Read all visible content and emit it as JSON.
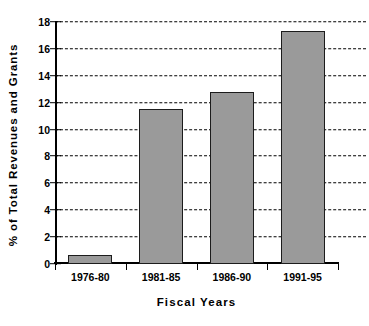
{
  "chart_data": {
    "type": "bar",
    "title": "",
    "categories": [
      "1976-80",
      "1981-85",
      "1986-90",
      "1991-95"
    ],
    "values": [
      0.7,
      11.5,
      12.8,
      17.3
    ],
    "xlabel": "Fiscal  Years",
    "ylabel": "% of Total Revenues and Grants",
    "ylim": [
      0,
      18
    ],
    "yticks": [
      0,
      2,
      4,
      6,
      8,
      10,
      12,
      14,
      16,
      18
    ],
    "ytick_labels": [
      "0",
      "2",
      "4",
      "6",
      "8",
      "10",
      "12",
      "14",
      "16",
      "18"
    ],
    "grid": true,
    "grid_style": "dashed",
    "grid_axis": "y",
    "legend": false,
    "bar_color": "#9a9a9a",
    "bar_edge_color": "#1c1c1c",
    "axis_color": "#000000",
    "background_color": "#ffffff"
  }
}
